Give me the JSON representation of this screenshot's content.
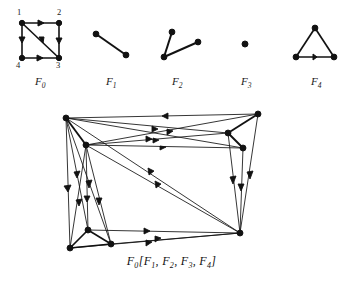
{
  "figure": {
    "title_caption": "F0[F1, F2, F3, F4]",
    "caption_parts": {
      "head": "F",
      "head_sub": "0",
      "open": "[",
      "close": "]",
      "comma": ","
    },
    "background_color": "#ffffff",
    "ink_color": "#121212"
  },
  "factors": [
    {
      "name": "F",
      "subscript": "0",
      "label": "F0",
      "label_x": 40,
      "label_y": 78,
      "description": "directed square with diagonal, vertices 1 2 3 4",
      "vertex_count": 4,
      "vertex_labels": [
        "1",
        "2",
        "3",
        "4"
      ],
      "edges": [
        "1->2",
        "2->3",
        "4->3",
        "1->4",
        "1->3"
      ]
    },
    {
      "name": "F",
      "subscript": "1",
      "label": "F1",
      "label_x": 110,
      "label_y": 78,
      "description": "single undirected edge, two vertices",
      "vertex_count": 2,
      "vertex_labels": [],
      "edges": [
        "a-b"
      ]
    },
    {
      "name": "F",
      "subscript": "2",
      "label": "F2",
      "label_x": 176,
      "label_y": 78,
      "description": "path on three vertices forming a V",
      "vertex_count": 3,
      "vertex_labels": [],
      "edges": [
        "a-b",
        "b-c"
      ]
    },
    {
      "name": "F",
      "subscript": "3",
      "label": "F3",
      "label_x": 245,
      "label_y": 78,
      "description": "single isolated vertex",
      "vertex_count": 1,
      "vertex_labels": [],
      "edges": []
    },
    {
      "name": "F",
      "subscript": "4",
      "label": "F4",
      "label_x": 315,
      "label_y": 78,
      "description": "triangle on three vertices",
      "vertex_count": 3,
      "vertex_labels": [],
      "edges": [
        "a-b",
        "b-c",
        "c-a"
      ]
    }
  ],
  "composition": {
    "label": "F0[F1, F2, F3, F4]",
    "caption_x": 171,
    "caption_y": 258,
    "clusters": [
      {
        "factor": "F1",
        "position": "top-left",
        "vertex_count": 2
      },
      {
        "factor": "F2",
        "position": "top-right",
        "vertex_count": 3
      },
      {
        "factor": "F3",
        "position": "bottom-right",
        "vertex_count": 1
      },
      {
        "factor": "F4",
        "position": "bottom-left",
        "vertex_count": 3
      }
    ]
  },
  "vertex_numbers": [
    {
      "text": "1",
      "x": 17,
      "y": 11
    },
    {
      "text": "2",
      "x": 57,
      "y": 11
    },
    {
      "text": "3",
      "x": 57,
      "y": 62
    },
    {
      "text": "4",
      "x": 16,
      "y": 62
    }
  ]
}
